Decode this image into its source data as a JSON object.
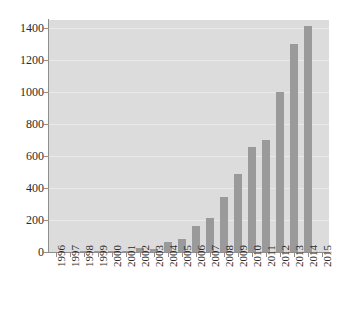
{
  "chart_data": {
    "type": "bar",
    "title": "",
    "subtitle": "",
    "xlabel": "",
    "ylabel": "",
    "grid": true,
    "legend": "none",
    "xlim": [
      "1996",
      "2015"
    ],
    "ylim": [
      0,
      1450
    ],
    "ytick_values": [
      0,
      200,
      400,
      600,
      800,
      1000,
      1200,
      1400
    ],
    "ytick_labels": [
      "0",
      "200",
      "400",
      "600",
      "800",
      "1000",
      "1200",
      "1400"
    ],
    "categories": [
      "1996",
      "1997",
      "1998",
      "1999",
      "2000",
      "2001",
      "2002",
      "2003",
      "2004",
      "2005",
      "2006",
      "2007",
      "2008",
      "2009",
      "2010",
      "2011",
      "2012",
      "2013",
      "2014",
      "2015"
    ],
    "values": [
      0,
      0,
      3,
      3,
      8,
      8,
      25,
      20,
      62,
      82,
      160,
      212,
      345,
      490,
      657,
      700,
      997,
      1300,
      1410,
      0
    ],
    "series": [
      {
        "name": "count",
        "values": [
          0,
          0,
          3,
          3,
          8,
          8,
          25,
          20,
          62,
          82,
          160,
          212,
          345,
          490,
          657,
          700,
          997,
          1300,
          1410,
          0
        ]
      }
    ],
    "colors": {
      "bar": "#9a9a9a",
      "plot_background": "#dcdcdc",
      "figure_background": "#ffffff",
      "gridline": "#e9e9e9",
      "axis": "#8e8e8e",
      "tick_text": "#2b2b2b"
    }
  }
}
